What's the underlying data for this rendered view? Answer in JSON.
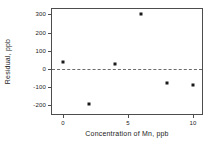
{
  "chart_data": {
    "type": "scatter",
    "title": "",
    "xlabel": "Concentration of Mn, ppb",
    "ylabel": "Residual, ppb",
    "x": [
      0,
      2,
      4,
      6,
      8,
      10
    ],
    "values": [
      40,
      -195,
      25,
      300,
      -78,
      -88
    ],
    "series": [
      {
        "name": "Residual",
        "x": [
          0,
          2,
          4,
          6,
          8,
          10
        ],
        "values": [
          40,
          -195,
          25,
          300,
          -78,
          -88
        ]
      }
    ],
    "xlim": [
      -0.85,
      10.85
    ],
    "ylim": [
      -260,
      330
    ],
    "xticks": [
      0,
      5,
      10
    ],
    "xtick_labels": [
      "0",
      "5",
      "10"
    ],
    "yticks": [
      300,
      200,
      100,
      0,
      -100,
      -200
    ],
    "ytick_labels": [
      "300",
      "200",
      "100",
      "0",
      "-100",
      "-200"
    ],
    "grid": false,
    "legend": false,
    "reference_lines": [
      {
        "name": "zero-reference",
        "orientation": "horizontal",
        "value": 0,
        "style": "dashed"
      }
    ],
    "marker": "square",
    "marker_color": "#1a1a1a",
    "axis_color": "#4d4d4d",
    "background_color": "#ffffff"
  }
}
